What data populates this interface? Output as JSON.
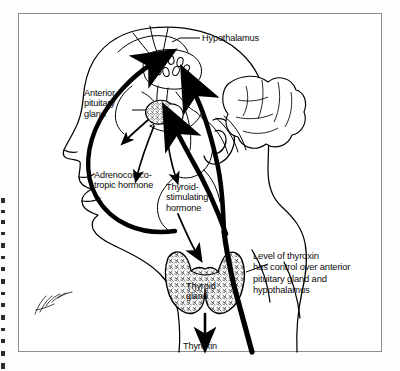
{
  "figure": {
    "line_color": "#000000",
    "background_color": "#ffffff",
    "frame_color": "#8d8d8d"
  },
  "labels": {
    "hypothalamus": "Hypothalamus",
    "anterior_pituitary": "Anterior\npituitary\ngland",
    "acth": "Adrenocortico-\ntropic hormone",
    "tsh": "Thyroid-\nstimulating\nhormone",
    "thyroid_gland": "Thyroid\ngland",
    "thyroxin": "Thyroxin",
    "feedback_note": "Level of thyroxin\nhas control over anterior\npituitary gland and\nhypothalamus"
  },
  "parts": {
    "head_profile": "head-profile-outline",
    "cerebellum": "cerebellum-outline",
    "hypothalamus_nuclei": "hypothalamus-nuclei",
    "pituitary_body": "pituitary-gland-body",
    "thyroid_body": "thyroid-gland-body",
    "signature": "artist-signature-mark"
  },
  "arrows": {
    "acth_arrow": "arrow-pituitary-to-acth",
    "tsh_arrow": "arrow-pituitary-to-tsh",
    "tsh_to_thyroid": "arrow-tsh-to-thyroid",
    "thyroid_to_thyroxin": "arrow-thyroid-to-thyroxin",
    "feedback_to_hypothalamus": "thick-feedback-arrow-to-hypothalamus",
    "feedback_to_pituitary": "thick-feedback-arrow-to-pituitary",
    "feedback_left_sweep": "thick-feedback-arrow-left-sweep"
  }
}
